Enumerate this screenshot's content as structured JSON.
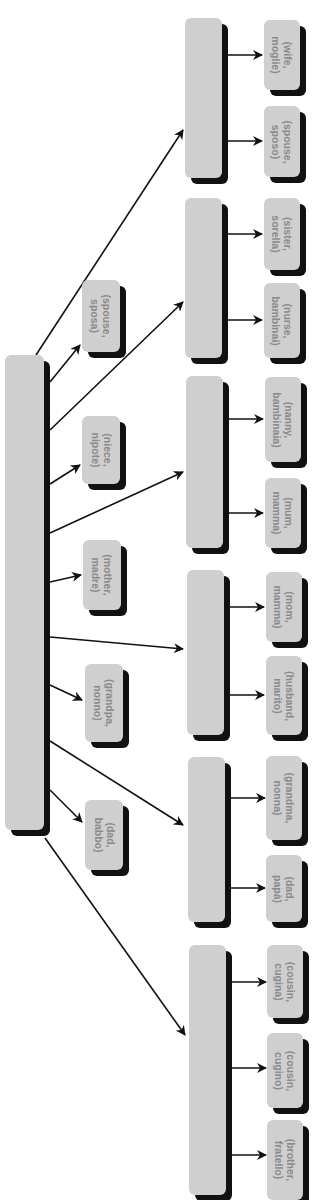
{
  "diagram": {
    "colors": {
      "box_fill": "#cfcfcf",
      "box_shadow": "#111111",
      "text": "#8a8a8a",
      "line": "#111111"
    },
    "root": {
      "id": "root",
      "x": 5,
      "y": 355,
      "w": 39,
      "h": 475,
      "label": ""
    },
    "middle_leaves": [
      {
        "id": "mid-spouse-sposa",
        "x": 82,
        "y": 280,
        "w": 38,
        "h": 72,
        "label": "(spouse,\nsposa)"
      },
      {
        "id": "mid-niece-nipote",
        "x": 82,
        "y": 416,
        "w": 38,
        "h": 68,
        "label": "(niece,\nnipote)"
      },
      {
        "id": "mid-mother-madre",
        "x": 83,
        "y": 540,
        "w": 38,
        "h": 70,
        "label": "(mother,\nmadre)"
      },
      {
        "id": "mid-grandpa-nonno",
        "x": 85,
        "y": 664,
        "w": 38,
        "h": 78,
        "label": "(grandpa,\nnonno)"
      },
      {
        "id": "mid-dad-babbo",
        "x": 85,
        "y": 800,
        "w": 38,
        "h": 70,
        "label": "(dad,\nbabbo)"
      }
    ],
    "groups": [
      {
        "id": "group-1",
        "x": 185,
        "y": 18,
        "w": 37,
        "h": 160,
        "leaves": [
          {
            "id": "leaf-wife-moglie",
            "x": 264,
            "y": 20,
            "w": 36,
            "h": 70,
            "label": "(wife,\nmoglie)"
          },
          {
            "id": "leaf-spouse-sposo",
            "x": 264,
            "y": 106,
            "w": 36,
            "h": 71,
            "label": "(spouse,\nsposo)"
          }
        ]
      },
      {
        "id": "group-2",
        "x": 185,
        "y": 198,
        "w": 37,
        "h": 160,
        "leaves": [
          {
            "id": "leaf-sister-sorella",
            "x": 264,
            "y": 198,
            "w": 36,
            "h": 72,
            "label": "(sister,\nsorella)"
          },
          {
            "id": "leaf-nurse-bambinai",
            "x": 264,
            "y": 283,
            "w": 36,
            "h": 75,
            "label": "(nurse,\nbambinai)"
          }
        ]
      },
      {
        "id": "group-3",
        "x": 186,
        "y": 376,
        "w": 37,
        "h": 172,
        "leaves": [
          {
            "id": "leaf-nanny-bambinaia",
            "x": 265,
            "y": 377,
            "w": 36,
            "h": 85,
            "label": "(nanny,\nbambinaia)"
          },
          {
            "id": "leaf-mum-mamma",
            "x": 265,
            "y": 478,
            "w": 36,
            "h": 70,
            "label": "(mum,\nmamma)"
          }
        ]
      },
      {
        "id": "group-4",
        "x": 187,
        "y": 570,
        "w": 37,
        "h": 165,
        "leaves": [
          {
            "id": "leaf-mom-mamma",
            "x": 266,
            "y": 572,
            "w": 36,
            "h": 70,
            "label": "(mom,\nmamma)"
          },
          {
            "id": "leaf-husband-marito",
            "x": 266,
            "y": 656,
            "w": 36,
            "h": 79,
            "label": "(husband,\nmarito)"
          }
        ]
      },
      {
        "id": "group-5",
        "x": 188,
        "y": 757,
        "w": 37,
        "h": 165,
        "leaves": [
          {
            "id": "leaf-grandma-nonna",
            "x": 266,
            "y": 756,
            "w": 36,
            "h": 84,
            "label": "(grandma,\nnonna)"
          },
          {
            "id": "leaf-dad-papa",
            "x": 266,
            "y": 855,
            "w": 36,
            "h": 67,
            "label": "(dad,\npapà)"
          }
        ]
      },
      {
        "id": "group-6",
        "x": 189,
        "y": 945,
        "w": 37,
        "h": 250,
        "leaves": [
          {
            "id": "leaf-cousin-cugina",
            "x": 267,
            "y": 945,
            "w": 36,
            "h": 73,
            "label": "(cousin,\ncugina)"
          },
          {
            "id": "leaf-cousin-cugino",
            "x": 267,
            "y": 1033,
            "w": 36,
            "h": 75,
            "label": "(cousin,\ncugino)"
          },
          {
            "id": "leaf-brother-fratello",
            "x": 267,
            "y": 1120,
            "w": 36,
            "h": 80,
            "label": "(brother,\nfratello)"
          }
        ]
      }
    ],
    "arrows": [
      {
        "from": [
          36,
          355
        ],
        "to": [
          183,
          130
        ]
      },
      {
        "from": [
          50,
          382
        ],
        "to": [
          80,
          345
        ]
      },
      {
        "from": [
          50,
          430
        ],
        "to": [
          183,
          302
        ]
      },
      {
        "from": [
          50,
          484
        ],
        "to": [
          80,
          465
        ]
      },
      {
        "from": [
          50,
          533
        ],
        "to": [
          183,
          472
        ]
      },
      {
        "from": [
          50,
          582
        ],
        "to": [
          81,
          575
        ]
      },
      {
        "from": [
          50,
          637
        ],
        "to": [
          183,
          649
        ]
      },
      {
        "from": [
          50,
          685
        ],
        "to": [
          82,
          700
        ]
      },
      {
        "from": [
          50,
          741
        ],
        "to": [
          183,
          825
        ]
      },
      {
        "from": [
          50,
          790
        ],
        "to": [
          82,
          822
        ]
      },
      {
        "from": [
          45,
          838
        ],
        "to": [
          185,
          1035
        ]
      },
      {
        "from": [
          228,
          55
        ],
        "to": [
          262,
          55
        ]
      },
      {
        "from": [
          228,
          141
        ],
        "to": [
          262,
          141
        ]
      },
      {
        "from": [
          228,
          234
        ],
        "to": [
          262,
          234
        ]
      },
      {
        "from": [
          228,
          320
        ],
        "to": [
          262,
          320
        ]
      },
      {
        "from": [
          229,
          419
        ],
        "to": [
          263,
          419
        ]
      },
      {
        "from": [
          229,
          513
        ],
        "to": [
          263,
          513
        ]
      },
      {
        "from": [
          230,
          607
        ],
        "to": [
          264,
          607
        ]
      },
      {
        "from": [
          230,
          695
        ],
        "to": [
          264,
          695
        ]
      },
      {
        "from": [
          231,
          798
        ],
        "to": [
          265,
          798
        ]
      },
      {
        "from": [
          231,
          888
        ],
        "to": [
          265,
          888
        ]
      },
      {
        "from": [
          232,
          982
        ],
        "to": [
          266,
          982
        ]
      },
      {
        "from": [
          232,
          1068
        ],
        "to": [
          266,
          1068
        ]
      },
      {
        "from": [
          232,
          1155
        ],
        "to": [
          266,
          1155
        ]
      }
    ]
  }
}
